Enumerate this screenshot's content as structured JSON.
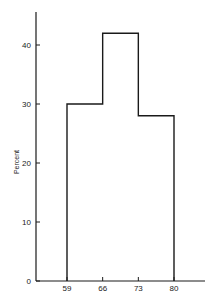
{
  "chart_data": {
    "type": "bar",
    "subtype": "histogram",
    "title": "",
    "xlabel": "",
    "ylabel": "Percent",
    "bins": [
      59,
      66,
      73,
      80
    ],
    "categories": [
      "59-66",
      "66-73",
      "73-80"
    ],
    "values": [
      30,
      42,
      28
    ],
    "x_ticks": [
      "59",
      "66",
      "73",
      "80"
    ],
    "y_ticks": [
      "0",
      "10",
      "20",
      "30",
      "40"
    ],
    "ylim": [
      0,
      45
    ],
    "grid": false,
    "legend": null
  },
  "colors": {
    "line": "#1a1a1a",
    "background": "#ffffff"
  }
}
